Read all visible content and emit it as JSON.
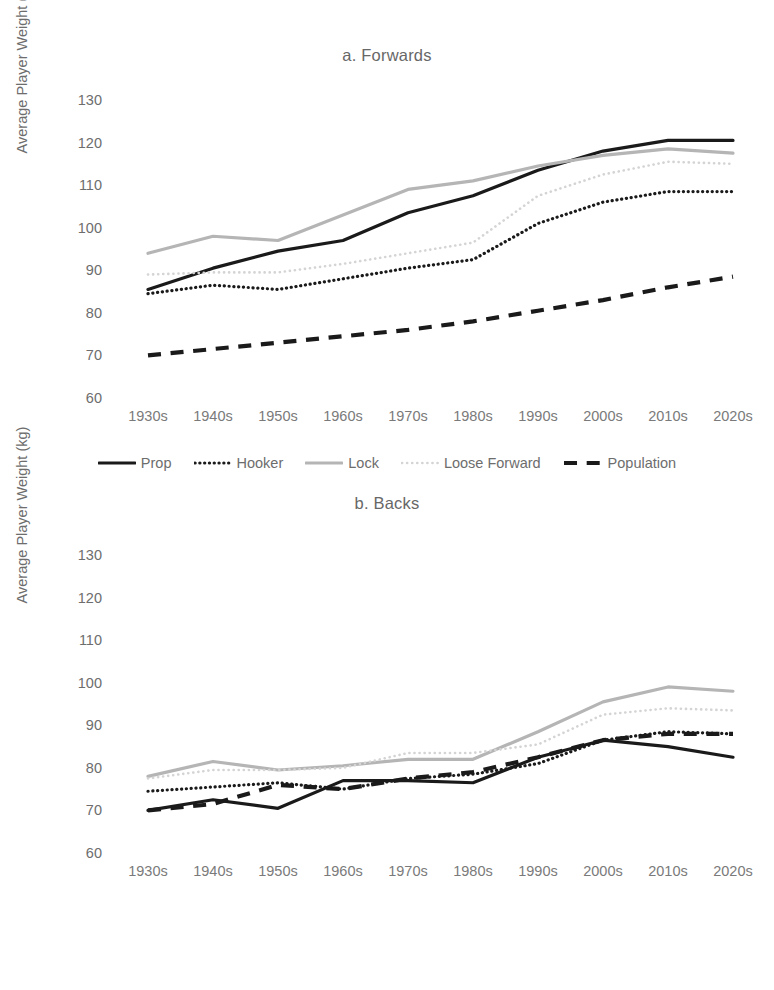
{
  "figure": {
    "ylabel": "Average Player Weight (kg)",
    "yticks": [
      130,
      120,
      110,
      100,
      90,
      80,
      70,
      60
    ],
    "xticks": [
      "1930s",
      "1940s",
      "1950s",
      "1960s",
      "1970s",
      "1980s",
      "1990s",
      "2000s",
      "2010s",
      "2020s"
    ],
    "colors": {
      "dark": "#1a1a1a",
      "gray": "#b5b5b5",
      "light_gray": "#d4d4d4",
      "text": "#6d6d6d"
    }
  },
  "chart_data": [
    {
      "type": "line",
      "title": "a. Forwards",
      "xlabel": "",
      "ylabel": "Average Player Weight (kg)",
      "categories": [
        "1930s",
        "1940s",
        "1950s",
        "1960s",
        "1970s",
        "1980s",
        "1990s",
        "2000s",
        "2010s",
        "2020s"
      ],
      "ylim": [
        60,
        130
      ],
      "grid": false,
      "legend_position": "bottom",
      "series": [
        {
          "name": "Prop",
          "style": "solid",
          "color": "#1a1a1a",
          "width": 3.2,
          "values": [
            85.5,
            90.5,
            94.5,
            97.0,
            103.5,
            107.5,
            113.5,
            118.0,
            120.5,
            120.5
          ]
        },
        {
          "name": "Hooker",
          "style": "dotted",
          "color": "#1a1a1a",
          "width": 3.2,
          "values": [
            84.5,
            86.5,
            85.5,
            88.0,
            90.5,
            92.5,
            101.0,
            106.0,
            108.5,
            108.5
          ]
        },
        {
          "name": "Lock",
          "style": "solid",
          "color": "#b5b5b5",
          "width": 3.2,
          "values": [
            94.0,
            98.0,
            97.0,
            103.0,
            109.0,
            111.0,
            114.5,
            117.0,
            118.5,
            117.5
          ]
        },
        {
          "name": "Loose Forward",
          "style": "fine-dotted",
          "color": "#d4d4d4",
          "width": 2.6,
          "values": [
            89.0,
            89.5,
            89.5,
            91.5,
            94.0,
            96.5,
            107.5,
            112.5,
            115.5,
            115.0
          ]
        },
        {
          "name": "Population",
          "style": "dashed",
          "color": "#1a1a1a",
          "width": 4.2,
          "values": [
            70.0,
            71.5,
            73.0,
            74.5,
            76.0,
            78.0,
            80.5,
            83.0,
            86.0,
            88.5
          ]
        }
      ]
    },
    {
      "type": "line",
      "title": "b. Backs",
      "xlabel": "",
      "ylabel": "Average Player Weight (kg)",
      "categories": [
        "1930s",
        "1940s",
        "1950s",
        "1960s",
        "1970s",
        "1980s",
        "1990s",
        "2000s",
        "2010s",
        "2020s"
      ],
      "ylim": [
        60,
        130
      ],
      "grid": false,
      "legend_position": "bottom",
      "series": [
        {
          "name": "Scrum-Half",
          "style": "solid",
          "color": "#1a1a1a",
          "width": 3.2,
          "values": [
            70.0,
            72.5,
            70.5,
            77.0,
            77.0,
            76.5,
            82.5,
            86.5,
            85.0,
            82.5
          ]
        },
        {
          "name": "Fly-Half",
          "style": "dotted",
          "color": "#1a1a1a",
          "width": 3.2,
          "values": [
            74.5,
            75.5,
            76.5,
            75.0,
            77.5,
            78.5,
            81.0,
            86.5,
            88.5,
            88.0
          ]
        },
        {
          "name": "Centre",
          "style": "solid",
          "color": "#b5b5b5",
          "width": 3.2,
          "values": [
            78.0,
            81.5,
            79.5,
            80.5,
            82.0,
            82.0,
            88.5,
            95.5,
            99.0,
            98.0
          ]
        },
        {
          "name": "Outside Back",
          "style": "fine-dotted",
          "color": "#d4d4d4",
          "width": 2.6,
          "values": [
            77.5,
            79.5,
            79.5,
            80.0,
            83.5,
            83.5,
            85.5,
            92.5,
            94.0,
            93.5
          ]
        },
        {
          "name": "Population",
          "style": "dashed",
          "color": "#1a1a1a",
          "width": 4.2,
          "values": [
            70.0,
            71.5,
            76.0,
            75.0,
            77.5,
            79.0,
            82.5,
            86.5,
            88.0,
            88.0
          ]
        }
      ]
    }
  ]
}
